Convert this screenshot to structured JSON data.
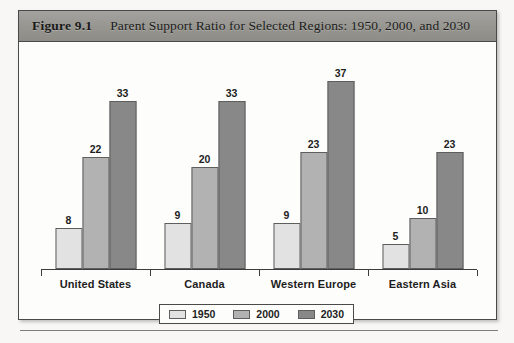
{
  "figure": {
    "number": "Figure 9.1",
    "title": "Parent Support Ratio for Selected Regions: 1950, 2000, and 2030"
  },
  "chart_data": {
    "type": "bar",
    "title": "Parent Support Ratio for Selected Regions: 1950, 2000, and 2030",
    "xlabel": "",
    "ylabel": "",
    "ylim": [
      0,
      40
    ],
    "grid": false,
    "legend_position": "bottom",
    "categories": [
      "United States",
      "Canada",
      "Western Europe",
      "Eastern Asia"
    ],
    "series": [
      {
        "name": "1950",
        "color": "#e2e2e2",
        "values": [
          8,
          9,
          9,
          5
        ]
      },
      {
        "name": "2000",
        "color": "#b2b2b2",
        "values": [
          22,
          20,
          23,
          10
        ]
      },
      {
        "name": "2030",
        "color": "#888888",
        "values": [
          33,
          33,
          37,
          23
        ]
      }
    ]
  }
}
